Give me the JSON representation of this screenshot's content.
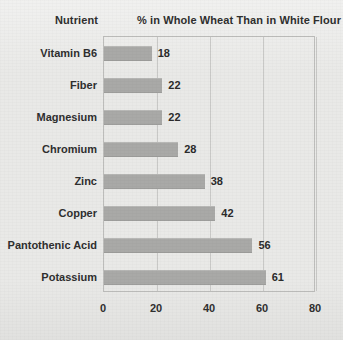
{
  "header": {
    "category_header": "Nutrient",
    "value_header": "% in Whole Wheat Than in White Flour"
  },
  "chart_data": {
    "type": "bar",
    "orientation": "horizontal",
    "title": "% in Whole Wheat Than in White Flour",
    "xlabel": "",
    "ylabel": "Nutrient",
    "categories": [
      "Vitamin B6",
      "Fiber",
      "Magnesium",
      "Chromium",
      "Zinc",
      "Copper",
      "Pantothenic Acid",
      "Potassium"
    ],
    "values": [
      18,
      22,
      22,
      28,
      38,
      42,
      56,
      61
    ],
    "value_labels": [
      "18",
      "22",
      "22",
      "28",
      "38",
      "42",
      "56",
      "61"
    ],
    "xlim": [
      0,
      80
    ],
    "xticks": [
      0,
      20,
      40,
      60,
      80
    ],
    "xtick_labels": [
      "0",
      "20",
      "40",
      "60",
      "80"
    ],
    "grid": true,
    "legend": false,
    "bar_color": "#a9a9a7",
    "background_color": "#e9e9e7",
    "axis_color": "#bdbdbb",
    "text_color": "#2f2f2f"
  }
}
